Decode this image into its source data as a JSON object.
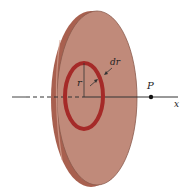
{
  "figure": {
    "labels": {
      "radius": "r",
      "ring_width": "dr",
      "point": "P",
      "axis": "x"
    },
    "colors": {
      "disk_face": "#c08a7a",
      "disk_edge": "#a8604f",
      "disk_outline": "#7a4a3e",
      "ring": "#a52a28",
      "axis": "#333333",
      "point": "#111111"
    }
  }
}
